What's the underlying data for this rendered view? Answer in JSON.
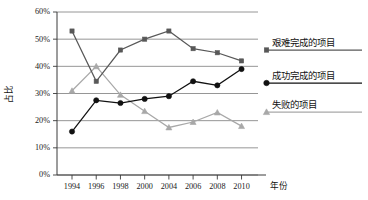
{
  "chart_data": {
    "type": "line",
    "title": "",
    "xlabel": "年份",
    "ylabel": "占比",
    "categories": [
      "1994",
      "1996",
      "1998",
      "2000",
      "2004",
      "2006",
      "2008",
      "2010"
    ],
    "x": [
      1994,
      1996,
      1998,
      2000,
      2004,
      2006,
      2008,
      2010
    ],
    "ylim": [
      0,
      60
    ],
    "yticks": [
      "0%",
      "10%",
      "20%",
      "30%",
      "40%",
      "50%",
      "60%"
    ],
    "ytick_values": [
      0,
      10,
      20,
      30,
      40,
      50,
      60
    ],
    "grid": true,
    "legend_position": "right",
    "series": [
      {
        "name": "艰难完成的项目",
        "marker": "square",
        "color": "#585858",
        "values": [
          53,
          34.5,
          46,
          50,
          53,
          46.5,
          45,
          42
        ]
      },
      {
        "name": "成功完成的项目",
        "marker": "circle",
        "color": "#111111",
        "values": [
          16,
          27.5,
          26.5,
          28,
          29,
          34.5,
          33,
          39
        ]
      },
      {
        "name": "失败的项目",
        "marker": "triangle",
        "color": "#a8a8a8",
        "values": [
          31,
          40,
          29.5,
          23.5,
          17.5,
          19.5,
          23,
          18
        ]
      }
    ]
  },
  "legend": {
    "items": [
      {
        "label": "艰难完成的项目"
      },
      {
        "label": "成功完成的项目"
      },
      {
        "label": "失败的项目"
      }
    ]
  },
  "colors": {
    "axis": "#3a3a3a",
    "grid": "#8a8a8a",
    "series_hard": "#585858",
    "series_success": "#111111",
    "series_failed": "#a8a8a8",
    "background": "#ffffff"
  }
}
